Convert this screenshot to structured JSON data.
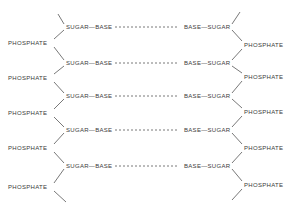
{
  "diagram": {
    "type": "dna-backbone-schematic",
    "left_strand": {
      "phosphates": [
        "PHOSPHATE",
        "PHOSPHATE",
        "PHOSPHATE",
        "PHOSPHATE",
        "PHOSPHATE"
      ],
      "nucleotides": [
        "SUGAR—BASE",
        "SUGAR—BASE",
        "SUGAR—BASE",
        "SUGAR—BASE",
        "SUGAR—BASE"
      ]
    },
    "right_strand": {
      "phosphates": [
        "PHOSPHATE",
        "PHOSPHATE",
        "PHOSPHATE",
        "PHOSPHATE",
        "PHOSPHATE"
      ],
      "nucleotides": [
        "BASE—SUGAR",
        "BASE—SUGAR",
        "BASE—SUGAR",
        "BASE—SUGAR",
        "BASE—SUGAR"
      ]
    },
    "pair_bond": "- - - - - - - - - -",
    "rows_y": [
      27,
      63,
      96,
      130,
      166
    ],
    "left_phosphate_y": [
      43,
      78,
      113,
      148,
      187
    ],
    "right_phosphate_y": [
      45,
      77,
      112,
      148,
      185
    ],
    "line_color": "#555555"
  }
}
